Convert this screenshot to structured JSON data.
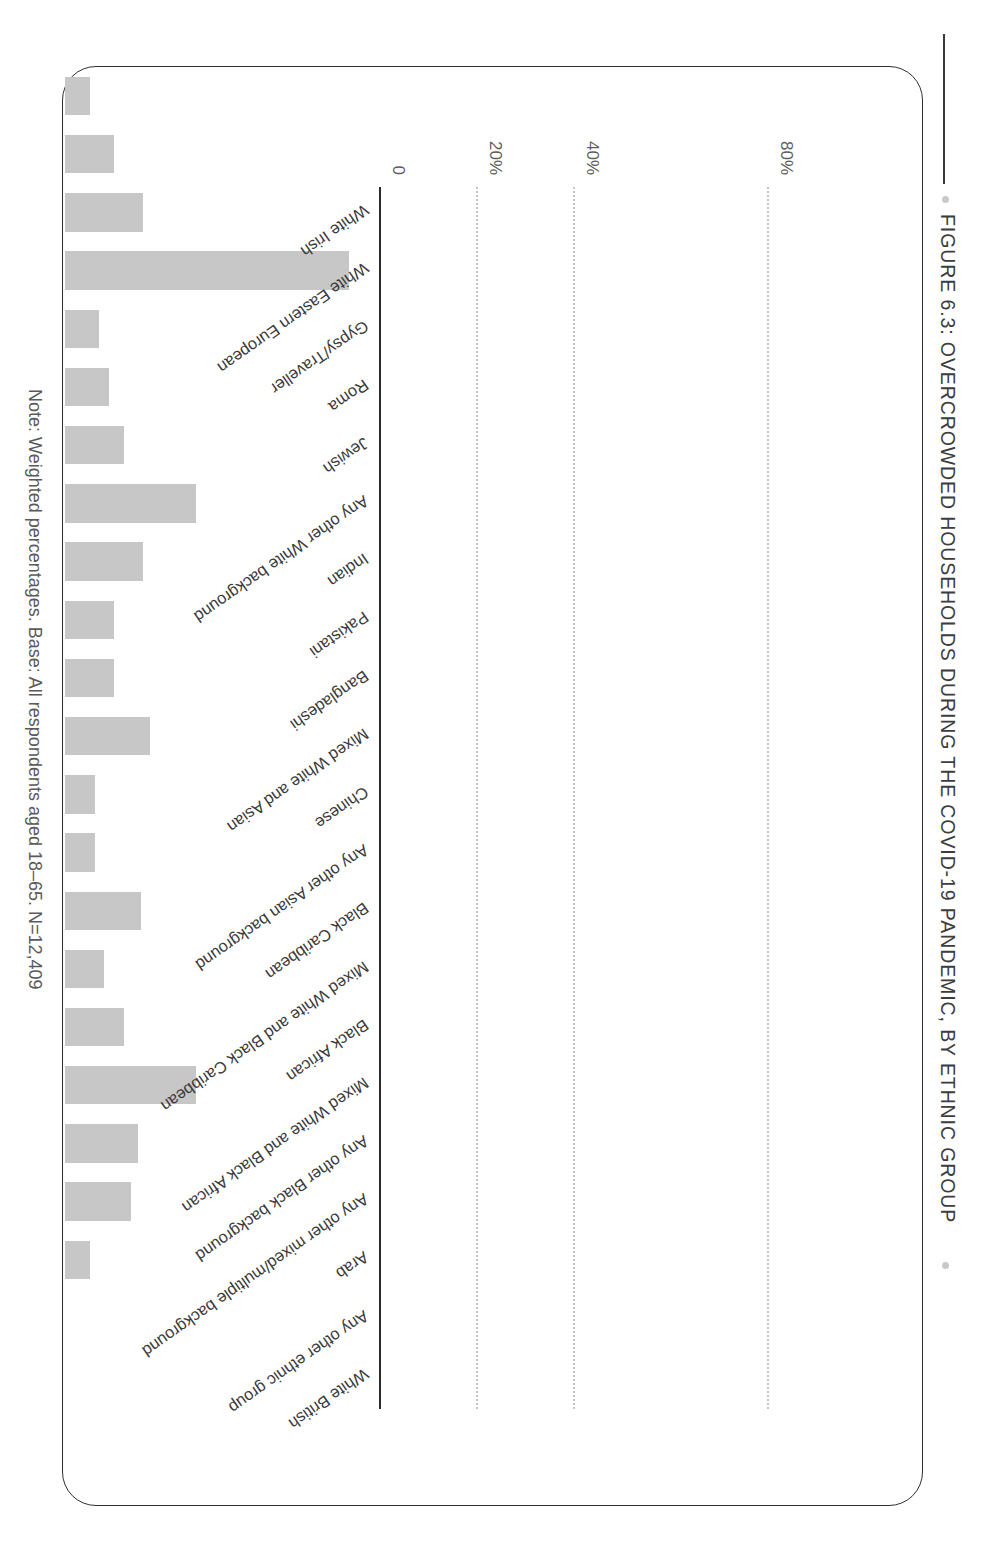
{
  "figure": {
    "title": "FIGURE 6.3: OVERCROWDED HOUSEHOLDS DURING THE COVID-19 PANDEMIC, BY ETHNIC GROUP",
    "note": "Note: Weighted percentages. Base: All respondents aged 18–65. N=12,409",
    "bar_color": "#c7c7c7",
    "axis_color": "#2b2b2b",
    "grid_color": "#c3c3c3",
    "title_color": "#3d3d3d"
  },
  "chart_data": {
    "type": "bar",
    "title": "FIGURE 6.3: OVERCROWDED HOUSEHOLDS DURING THE COVID-19 PANDEMIC, BY ETHNIC GROUP",
    "xlabel": "",
    "ylabel": "",
    "ylim": [
      0,
      90
    ],
    "grid": true,
    "legend": "none",
    "ytick_labels": [
      "0",
      "20%",
      "40%",
      "80%"
    ],
    "ytick_values": [
      0,
      20,
      40,
      80
    ],
    "categories": [
      "White Irish",
      "White Eastern European",
      "Gypsy/Traveller",
      "Roma",
      "Jewish",
      "Any other White background",
      "Indian",
      "Pakistani",
      "Bangladeshi",
      "Mixed White and Asian",
      "Chinese",
      "Any other Asian background",
      "Black Caribbean",
      "Mixed White and Black Caribbean",
      "Black African",
      "Mixed White and Black African",
      "Any other Black background",
      "Any other mixed/multiple background",
      "Arab",
      "Any other ethnic group",
      "White British"
    ],
    "values": [
      5,
      10,
      16,
      58.5,
      7,
      9,
      12,
      27,
      16,
      10,
      10,
      17.5,
      6,
      6,
      15.5,
      8,
      12,
      27,
      15,
      13.5,
      5
    ],
    "series": [
      {
        "name": "Overcrowded households",
        "values": [
          5,
          10,
          16,
          58.5,
          7,
          9,
          12,
          27,
          16,
          10,
          10,
          17.5,
          6,
          6,
          15.5,
          8,
          12,
          27,
          15,
          13.5,
          5
        ]
      }
    ]
  }
}
